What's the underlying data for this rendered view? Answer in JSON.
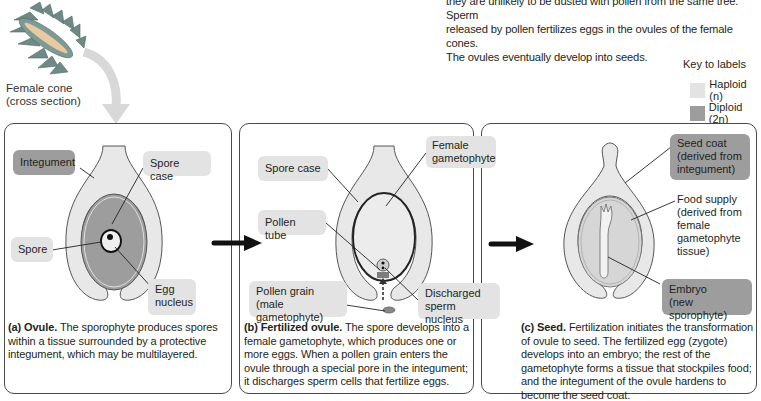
{
  "intro_text": {
    "line1": "they are unlikely to be dusted with pollen from the same tree. Sperm",
    "line2": "released by pollen fertilizes eggs in the ovules of the female cones.",
    "line3": "The ovules eventually develop into seeds."
  },
  "cone": {
    "label_line1": "Female cone",
    "label_line2": "(cross section)"
  },
  "key": {
    "title": "Key to labels",
    "items": [
      {
        "label": "Haploid (n)",
        "color": "#e3e3e3"
      },
      {
        "label": "Diploid (2n)",
        "color": "#9d9d9d"
      }
    ]
  },
  "colors": {
    "haploid": "#e3e3e3",
    "diploid": "#9d9d9d",
    "panel_border": "#4a4a4a",
    "arrow": "#111111",
    "cone_arrow": "#d8d8d8"
  },
  "panels": [
    {
      "id": "a",
      "labels": {
        "integument": "Integument",
        "spore_case": "Spore case",
        "spore": "Spore",
        "egg_nucleus_1": "Egg",
        "egg_nucleus_2": "nucleus"
      },
      "caption_title": "(a) Ovule.",
      "caption_text": " The sporophyte produces spores within a tissue surrounded by a protective integument, which may be multilayered."
    },
    {
      "id": "b",
      "labels": {
        "spore_case": "Spore case",
        "female_gametophyte_1": "Female",
        "female_gametophyte_2": "gametophyte",
        "pollen_tube": "Pollen tube",
        "pollen_grain_1": "Pollen grain (male",
        "pollen_grain_2": "gametophyte)",
        "discharged_1": "Discharged",
        "discharged_2": "sperm nucleus"
      },
      "caption_title": "(b) Fertilized ovule.",
      "caption_text": " The spore develops into a female gametophyte, which produces one or more eggs. When a pollen grain enters the ovule through a special pore in the integument; it discharges sperm cells that fertilize eggs."
    },
    {
      "id": "c",
      "labels": {
        "seed_coat_1": "Seed coat",
        "seed_coat_2": "(derived from",
        "seed_coat_3": "integument)",
        "food_supply_1": "Food supply",
        "food_supply_2": "(derived from",
        "food_supply_3": "female",
        "food_supply_4": "gametophyte",
        "food_supply_5": "tissue)",
        "embryo_1": "Embryo",
        "embryo_2": "(new sporophyte)"
      },
      "caption_title": "(c) Seed.",
      "caption_text": " Fertilization initiates the transformation of ovule to seed. The fertilized egg (zygote) develops into an embryo; the rest of the gametophyte forms a tissue that stockpiles food; and the integument of the ovule hardens to become the seed coat."
    }
  ]
}
